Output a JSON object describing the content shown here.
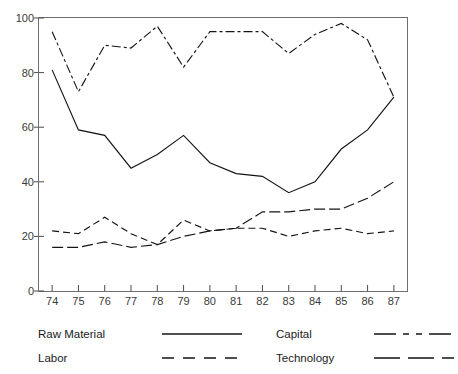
{
  "chart_data": {
    "type": "line",
    "title": "",
    "xlabel": "",
    "ylabel": "",
    "xlim": [
      73.5,
      87.5
    ],
    "ylim": [
      0,
      100
    ],
    "grid": false,
    "legend_position": "bottom",
    "categories": [
      "74",
      "75",
      "76",
      "77",
      "78",
      "79",
      "80",
      "81",
      "82",
      "83",
      "84",
      "85",
      "86",
      "87"
    ],
    "x": [
      74,
      75,
      76,
      77,
      78,
      79,
      80,
      81,
      82,
      83,
      84,
      85,
      86,
      87
    ],
    "yticks": [
      0,
      20,
      40,
      60,
      80,
      100
    ],
    "xticks": [
      "74",
      "75",
      "76",
      "77",
      "78",
      "79",
      "80",
      "81",
      "82",
      "83",
      "84",
      "85",
      "86",
      "87"
    ],
    "series": [
      {
        "name": "Raw Material",
        "dash": "solid",
        "values": [
          81,
          59,
          57,
          45,
          50,
          57,
          47,
          43,
          42,
          36,
          40,
          52,
          59,
          71
        ]
      },
      {
        "name": "Capital",
        "dash": "dash-dot",
        "values": [
          95,
          73,
          90,
          89,
          97,
          82,
          95,
          95,
          95,
          87,
          94,
          98,
          92,
          71
        ]
      },
      {
        "name": "Labor",
        "dash": "dashed",
        "values": [
          22,
          21,
          27,
          21,
          17,
          26,
          22,
          23,
          23,
          20,
          22,
          23,
          21,
          22
        ]
      },
      {
        "name": "Technology",
        "dash": "long-dash",
        "values": [
          16,
          16,
          18,
          16,
          17,
          20,
          22,
          23,
          29,
          29,
          30,
          30,
          34,
          40
        ]
      }
    ]
  },
  "legend": {
    "entries": [
      {
        "label": "Raw Material",
        "style": "solid"
      },
      {
        "label": "Capital",
        "style": "dash-dot"
      },
      {
        "label": "Labor",
        "style": "dashed"
      },
      {
        "label": "Technology",
        "style": "long-dash"
      }
    ]
  },
  "colors": {
    "line": "#141414",
    "frame": "#6e6e6e",
    "tick_text": "#3a3a3a",
    "background": "#ffffff"
  }
}
